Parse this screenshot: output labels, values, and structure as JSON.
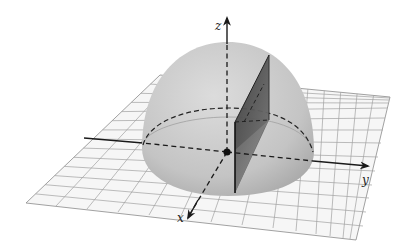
{
  "figure": {
    "axes": {
      "x_label": "x",
      "y_label": "y",
      "z_label": "z"
    },
    "colors": {
      "background": "#ffffff",
      "grid_line": "#9a9a9a",
      "grid_fill": "#f7f7f7",
      "hemisphere": "#c8c8c8",
      "hemisphere_shadow": "#a9a9a9",
      "plane_dark": "#4a4a4a",
      "plane_light": "#8c8c8c",
      "axis": "#1a1a1a"
    }
  }
}
